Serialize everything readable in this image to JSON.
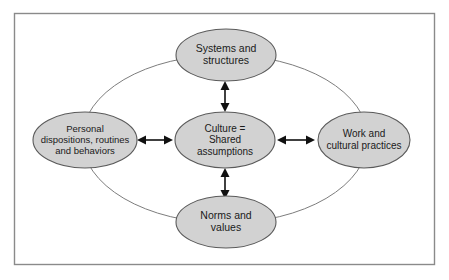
{
  "diagram": {
    "frame": {
      "name": "diagram-border"
    },
    "colors": {
      "node_fill": "#d2d2d2",
      "node_stroke": "#5a5a5a",
      "frame_stroke": "#8a8a8a",
      "oval_stroke": "#7d7d7d",
      "arrow": "#111111",
      "background": "#ffffff",
      "text": "#1a1a1a"
    },
    "nodes": {
      "top": {
        "id": "systems-and-structures",
        "lines": [
          "Systems and",
          "structures"
        ],
        "cx": 226,
        "cy": 55,
        "rx": 50,
        "ry": 26
      },
      "left": {
        "id": "personal-dispositions",
        "lines": [
          "Personal",
          "dispositions, routines",
          "and behaviors"
        ],
        "cx": 85,
        "cy": 140,
        "rx": 52,
        "ry": 28
      },
      "center": {
        "id": "culture-shared-assumptions",
        "lines": [
          "Culture =",
          "Shared",
          "assumptions"
        ],
        "cx": 225,
        "cy": 140,
        "rx": 50,
        "ry": 28
      },
      "right": {
        "id": "work-and-cultural-practices",
        "lines": [
          "Work and",
          "cultural practices"
        ],
        "cx": 364,
        "cy": 140,
        "rx": 46,
        "ry": 28
      },
      "bottom": {
        "id": "norms-and-values",
        "lines": [
          "Norms and",
          "values"
        ],
        "cx": 226,
        "cy": 222,
        "rx": 50,
        "ry": 26
      }
    },
    "connectors": {
      "big_oval": {
        "id": "encompassing-oval",
        "cx": 225,
        "cy": 139,
        "rx": 143,
        "ry": 84
      },
      "arrows": [
        {
          "id": "arrow-center-to-top",
          "orientation": "vertical",
          "double_headed": true
        },
        {
          "id": "arrow-center-to-bottom",
          "orientation": "vertical",
          "double_headed": true
        },
        {
          "id": "arrow-left-to-center",
          "orientation": "horizontal",
          "double_headed": true
        },
        {
          "id": "arrow-center-to-right",
          "orientation": "horizontal",
          "double_headed": true
        }
      ]
    }
  }
}
